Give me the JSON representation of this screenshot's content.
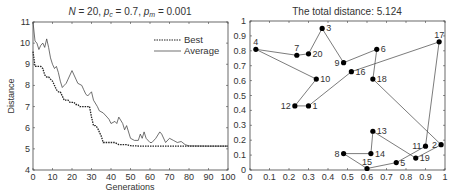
{
  "chart_data": [
    {
      "type": "line",
      "title": "N = 20,  p_c = 0.7,  p_m = 0.001",
      "title_parts": {
        "n": "N",
        "n_val": " = 20,  ",
        "pc": "p",
        "pc_sub": "c",
        "pc_val": " = 0.7,  ",
        "pm": "p",
        "pm_sub": "m",
        "pm_val": " = 0.001"
      },
      "xlabel": "Generations",
      "ylabel": "Distance",
      "xlim": [
        0,
        100
      ],
      "ylim": [
        4,
        11
      ],
      "xticks": [
        0,
        10,
        20,
        30,
        40,
        50,
        60,
        70,
        80,
        90,
        100
      ],
      "yticks": [
        4,
        5,
        6,
        7,
        8,
        9,
        10,
        11
      ],
      "grid": false,
      "legend_position": "upper right",
      "legend": [
        "Best",
        "Average"
      ],
      "series": [
        {
          "name": "Best",
          "style": "dotted",
          "x": [
            0,
            1,
            2,
            3,
            4,
            5,
            6,
            7,
            8,
            9,
            10,
            11,
            12,
            13,
            14,
            15,
            16,
            17,
            18,
            19,
            20,
            21,
            22,
            23,
            24,
            25,
            26,
            27,
            28,
            29,
            30,
            31,
            32,
            33,
            34,
            35,
            36,
            37,
            38,
            40,
            42,
            44,
            46,
            48,
            50,
            55,
            60,
            70,
            80,
            90,
            100
          ],
          "values": [
            9.6,
            8.9,
            8.9,
            8.9,
            8.9,
            8.8,
            8.5,
            8.4,
            8.4,
            8.3,
            8.2,
            8.0,
            7.8,
            7.7,
            7.7,
            7.5,
            7.3,
            7.3,
            7.3,
            7.2,
            7.2,
            7.2,
            7.1,
            7.1,
            7.0,
            7.0,
            7.0,
            7.0,
            7.0,
            7.0,
            6.5,
            6.1,
            6.1,
            6.0,
            5.8,
            5.6,
            5.3,
            5.3,
            5.3,
            5.3,
            5.3,
            5.2,
            5.2,
            5.2,
            5.15,
            5.13,
            5.13,
            5.124,
            5.124,
            5.124,
            5.124
          ]
        },
        {
          "name": "Average",
          "style": "solid",
          "x": [
            0,
            1,
            2,
            3,
            4,
            5,
            6,
            7,
            8,
            9,
            10,
            11,
            12,
            13,
            14,
            15,
            16,
            17,
            18,
            20,
            22,
            23,
            25,
            26,
            27,
            28,
            30,
            31,
            33,
            34,
            36,
            38,
            39,
            40,
            42,
            43,
            44,
            46,
            47,
            48,
            50,
            52,
            54,
            55,
            56,
            57,
            58,
            60,
            61,
            63,
            65,
            66,
            68,
            70,
            72,
            74,
            76,
            78,
            80,
            90,
            100
          ],
          "values": [
            11.0,
            10.1,
            10.0,
            9.7,
            9.9,
            10.0,
            9.8,
            10.2,
            9.8,
            9.3,
            9.0,
            8.8,
            8.9,
            8.6,
            8.2,
            7.9,
            8.0,
            8.1,
            8.3,
            8.7,
            8.3,
            8.1,
            8.0,
            7.8,
            7.6,
            7.5,
            7.7,
            7.3,
            7.0,
            6.8,
            6.7,
            6.5,
            6.4,
            6.2,
            6.3,
            6.2,
            6.5,
            6.2,
            5.9,
            6.1,
            5.5,
            5.4,
            5.4,
            5.7,
            5.5,
            5.8,
            5.5,
            5.3,
            5.3,
            5.5,
            5.8,
            5.7,
            5.3,
            5.5,
            5.4,
            5.3,
            5.35,
            5.2,
            5.14,
            5.13,
            5.13
          ]
        }
      ]
    },
    {
      "type": "scatter",
      "title": "The total distance: 5.124",
      "xlabel": "",
      "ylabel": "",
      "xlim": [
        0,
        1
      ],
      "ylim": [
        0,
        1
      ],
      "xticks": [
        0,
        0.1,
        0.2,
        0.3,
        0.4,
        0.5,
        0.6,
        0.7,
        0.8,
        0.9,
        1
      ],
      "yticks": [
        0,
        0.1,
        0.2,
        0.3,
        0.4,
        0.5,
        0.6,
        0.7,
        0.8,
        0.9,
        1
      ],
      "grid": false,
      "nodes": [
        {
          "id": 1,
          "x": 0.3,
          "y": 0.43,
          "label_pos": "right"
        },
        {
          "id": 2,
          "x": 0.98,
          "y": 0.17,
          "label_pos": "left"
        },
        {
          "id": 3,
          "x": 0.37,
          "y": 0.95,
          "label_pos": "right"
        },
        {
          "id": 4,
          "x": 0.03,
          "y": 0.81,
          "label_pos": "top"
        },
        {
          "id": 5,
          "x": 0.75,
          "y": 0.05,
          "label_pos": "right"
        },
        {
          "id": 6,
          "x": 0.65,
          "y": 0.81,
          "label_pos": "right"
        },
        {
          "id": 7,
          "x": 0.24,
          "y": 0.77,
          "label_pos": "top"
        },
        {
          "id": 8,
          "x": 0.48,
          "y": 0.11,
          "label_pos": "left"
        },
        {
          "id": 9,
          "x": 0.48,
          "y": 0.72,
          "label_pos": "left"
        },
        {
          "id": 10,
          "x": 0.34,
          "y": 0.61,
          "label_pos": "right"
        },
        {
          "id": 11,
          "x": 0.9,
          "y": 0.16,
          "label_pos": "left"
        },
        {
          "id": 12,
          "x": 0.23,
          "y": 0.43,
          "label_pos": "left"
        },
        {
          "id": 13,
          "x": 0.63,
          "y": 0.26,
          "label_pos": "right"
        },
        {
          "id": 14,
          "x": 0.62,
          "y": 0.11,
          "label_pos": "right"
        },
        {
          "id": 15,
          "x": 0.6,
          "y": 0.01,
          "label_pos": "top"
        },
        {
          "id": 16,
          "x": 0.52,
          "y": 0.66,
          "label_pos": "right"
        },
        {
          "id": 17,
          "x": 0.97,
          "y": 0.86,
          "label_pos": "top"
        },
        {
          "id": 18,
          "x": 0.63,
          "y": 0.61,
          "label_pos": "right"
        },
        {
          "id": 19,
          "x": 0.85,
          "y": 0.08,
          "label_pos": "right"
        },
        {
          "id": 20,
          "x": 0.3,
          "y": 0.78,
          "label_pos": "right"
        }
      ],
      "tour": [
        4,
        7,
        20,
        3,
        9,
        6,
        18,
        2,
        19,
        13,
        14,
        8,
        15,
        5,
        11,
        17,
        16,
        1,
        12,
        10,
        4
      ],
      "total_distance": 5.124
    }
  ]
}
